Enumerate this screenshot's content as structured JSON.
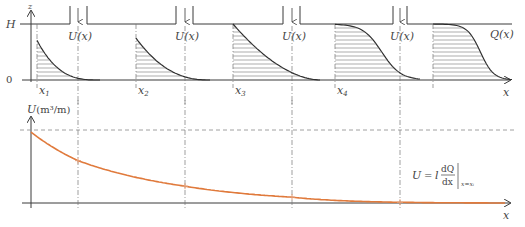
{
  "diagram": {
    "top_panel": {
      "z_axis_label": "z",
      "x_axis_label": "x",
      "level_top_label": "H",
      "level_bottom_label": "0",
      "outflow_label": "U(x)",
      "profile_label": "Q(x)",
      "sections": [
        {
          "label": "x",
          "sub": "1"
        },
        {
          "label": "x",
          "sub": "2"
        },
        {
          "label": "x",
          "sub": "3"
        },
        {
          "label": "x",
          "sub": "4"
        },
        {
          "label": "",
          "sub": ""
        }
      ],
      "outflow_count": 4
    },
    "bottom_panel": {
      "y_axis_label_var": "U",
      "y_axis_label_unit": "(m³/m)",
      "x_axis_label": "x",
      "formula": {
        "lhs": "U",
        "eq": "=",
        "coef": "l",
        "num": "dQ",
        "den": "dx",
        "eval": "x=xᵢ"
      }
    },
    "colors": {
      "curve": "#e07a3c",
      "ink": "#3a3a3a"
    }
  },
  "chart_data": {
    "type": "line",
    "title": "",
    "xlabel": "x",
    "ylabel": "U (m³/m)",
    "series": [
      {
        "name": "U(x)",
        "x": [
          0,
          1,
          2,
          3,
          4,
          5
        ],
        "x_labels": [
          "0",
          "x1 outflow",
          "x2 outflow",
          "x3 outflow",
          "x4 outflow",
          "end"
        ],
        "values": [
          0.97,
          0.58,
          0.23,
          0.08,
          0.01,
          0.0
        ]
      }
    ],
    "reference_line": {
      "y": 1.0,
      "style": "dashed"
    },
    "ylim": [
      0,
      1.1
    ],
    "grid": false
  }
}
